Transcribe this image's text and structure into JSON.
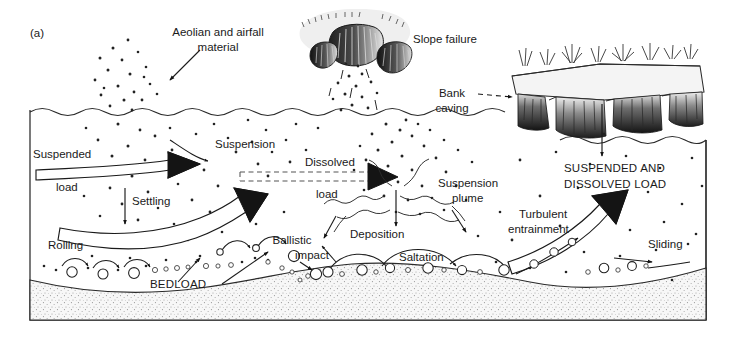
{
  "figure": {
    "panel_label": "(a)",
    "type": "scientific-diagram",
    "frame": {
      "x": 30,
      "y": 110,
      "width": 676,
      "height": 210,
      "stroke": "#333333"
    }
  },
  "colors": {
    "ink": "#1a1a1a",
    "line": "#333333",
    "bed_fill": "#f2f2f2",
    "bank_fill": "#ececec",
    "scar_dark": "#2b2b2b",
    "scar_light": "#f5f5f5",
    "grass": "#333333",
    "dot": "#222222"
  },
  "labels": {
    "aeolian": {
      "line1": "Aeolian and airfall",
      "line2": "material",
      "x": 218,
      "y": 36
    },
    "slope_failure": {
      "text": "Slope failure",
      "x": 413,
      "y": 43
    },
    "bank_caving": {
      "line1": "Bank",
      "line2": "caving",
      "x": 452,
      "y": 97
    },
    "suspended_load": {
      "line1": "Suspended",
      "line2": "load",
      "x": 33,
      "y": 158
    },
    "suspension": {
      "text": "Suspension",
      "x": 215,
      "y": 148
    },
    "dissolved_load": {
      "line1": "Dissolved",
      "line2": "load",
      "x": 305,
      "y": 166
    },
    "settling": {
      "text": "Settling",
      "x": 132,
      "y": 205
    },
    "suspension_plume": {
      "line1": "Suspension",
      "line2": "plume",
      "x": 438,
      "y": 187
    },
    "suspended_and_dissolved": {
      "line1": "SUSPENDED AND",
      "line2": "DISSOLVED LOAD",
      "x": 564,
      "y": 172
    },
    "turbulent_entrainment": {
      "line1": "Turbulent",
      "line2": "entrainment",
      "x": 519,
      "y": 218
    },
    "rolling": {
      "text": "Rolling",
      "x": 48,
      "y": 249
    },
    "ballistic_impact": {
      "line1": "Ballistic",
      "line2": "impact",
      "x": 292,
      "y": 244
    },
    "deposition": {
      "text": "Deposition",
      "x": 350,
      "y": 238
    },
    "saltation": {
      "text": "Saltation",
      "x": 399,
      "y": 261
    },
    "sliding": {
      "text": "Sliding",
      "x": 648,
      "y": 248
    },
    "bedload": {
      "text": "BEDLOAD",
      "x": 150,
      "y": 288
    }
  },
  "processes": [
    {
      "name": "Aeolian and airfall material",
      "zone": "above-water"
    },
    {
      "name": "Slope failure",
      "zone": "above-water"
    },
    {
      "name": "Bank caving",
      "zone": "above-water"
    },
    {
      "name": "Suspended load",
      "zone": "water-column"
    },
    {
      "name": "Suspension",
      "zone": "water-column"
    },
    {
      "name": "Dissolved load",
      "zone": "water-column"
    },
    {
      "name": "Settling",
      "zone": "water-column"
    },
    {
      "name": "Suspension plume",
      "zone": "water-column"
    },
    {
      "name": "Turbulent entrainment",
      "zone": "water-column"
    },
    {
      "name": "Deposition",
      "zone": "bed"
    },
    {
      "name": "Rolling",
      "zone": "bed"
    },
    {
      "name": "Saltation",
      "zone": "bed"
    },
    {
      "name": "Sliding",
      "zone": "bed"
    },
    {
      "name": "Ballistic impact",
      "zone": "bed"
    },
    {
      "name": "Bedload",
      "zone": "bed"
    }
  ]
}
